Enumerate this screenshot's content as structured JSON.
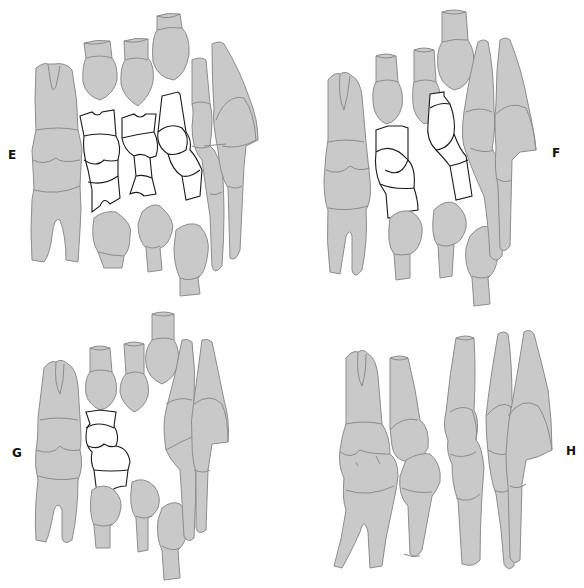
{
  "figure": {
    "panels": [
      {
        "id": "E",
        "label": "E",
        "position": "top-left",
        "description": "Mixed dentition: permanent molar, erupting teeth outlined in white among primary teeth"
      },
      {
        "id": "F",
        "label": "F",
        "position": "top-right",
        "description": "Mixed dentition with two outlined erupting teeth"
      },
      {
        "id": "G",
        "label": "G",
        "position": "bottom-left",
        "description": "Mixed dentition with one outlined erupting tooth"
      },
      {
        "id": "H",
        "label": "H",
        "position": "bottom-right",
        "description": "Permanent dentition in occlusion"
      }
    ],
    "caption_clipped": "",
    "colors": {
      "tooth_fill": "#c9c9c9",
      "tooth_outline": "#8c8c8c",
      "erupting_fill": "#ffffff",
      "erupting_outline": "#1a1a1a",
      "label_color": "#111111",
      "background": "#ffffff"
    }
  }
}
